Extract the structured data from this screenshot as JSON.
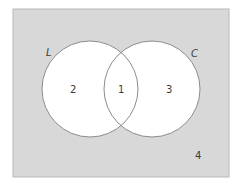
{
  "diagram": {
    "type": "venn",
    "universe": {
      "region_label": "4",
      "fill": "#d8d8d8",
      "stroke": "#b8b8b8"
    },
    "sets": [
      {
        "name": "L",
        "cx": 90,
        "cy": 89,
        "r": 48
      },
      {
        "name": "C",
        "cx": 152,
        "cy": 89,
        "r": 48
      }
    ],
    "regions": {
      "left_only": "2",
      "intersection": "1",
      "right_only": "3",
      "outside": "4"
    },
    "colors": {
      "circle_fill": "#ffffff",
      "circle_stroke": "#8c8c8c",
      "text": "#3a3a3a"
    }
  }
}
